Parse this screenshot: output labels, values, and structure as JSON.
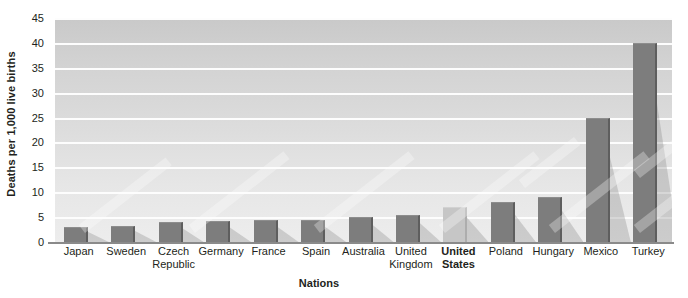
{
  "chart_data": {
    "type": "bar",
    "title": "",
    "xlabel": "Nations",
    "ylabel": "Deaths per 1,000 live births",
    "ylim": [
      0,
      45
    ],
    "ytick_step": 5,
    "yticks": [
      45,
      40,
      35,
      30,
      25,
      20,
      15,
      10,
      5,
      0
    ],
    "grid": true,
    "legend": "none",
    "categories": [
      "Japan",
      "Sweden",
      "Czech Republic",
      "Germany",
      "France",
      "Spain",
      "Australia",
      "United Kingdom",
      "United States",
      "Poland",
      "Hungary",
      "Mexico",
      "Turkey"
    ],
    "category_lines": [
      [
        "Japan",
        ""
      ],
      [
        "Sweden",
        ""
      ],
      [
        "Czech",
        "Republic"
      ],
      [
        "Germany",
        ""
      ],
      [
        "France",
        ""
      ],
      [
        "Spain",
        ""
      ],
      [
        "Australia",
        ""
      ],
      [
        "United",
        "Kingdom"
      ],
      [
        "United",
        "States"
      ],
      [
        "Poland",
        ""
      ],
      [
        "Hungary",
        ""
      ],
      [
        "Mexico",
        ""
      ],
      [
        "Turkey",
        ""
      ]
    ],
    "values": [
      3,
      3.2,
      4,
      4.2,
      4.4,
      4.5,
      5,
      5.5,
      7,
      8,
      9,
      25,
      40
    ],
    "highlight_index": 8,
    "highlight_label": "United States",
    "colors": {
      "bar": "#7d7d7d",
      "bar_side": "#5e5e5e",
      "bar_highlight": "#c6c6c6",
      "bar_highlight_side": "#adadad",
      "plot_background_top": "#c9c9c9",
      "plot_background_bottom": "#ededed",
      "gridline": "#fdfdfd",
      "axis": "#8a8a8a",
      "text": "#231f20",
      "page_background": "#ffffff"
    }
  }
}
